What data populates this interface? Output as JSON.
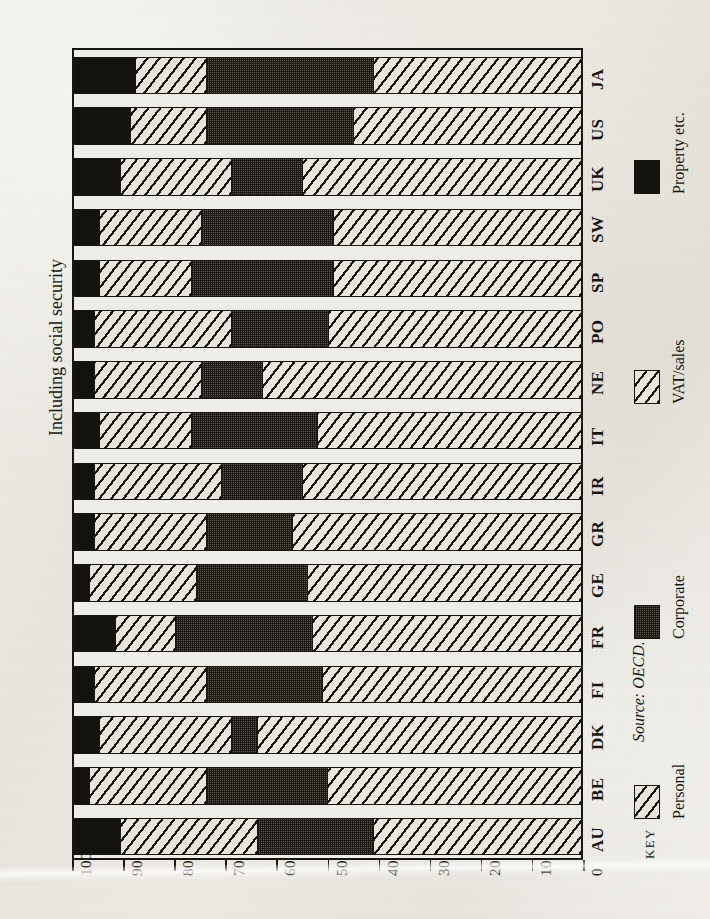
{
  "title": "Including social security",
  "source_note": "Source: OECD.",
  "key_word": "KEY",
  "axis": {
    "ticks": [
      100,
      90,
      80,
      70,
      60,
      50,
      40,
      30,
      20,
      10,
      0
    ],
    "tick_labels": [
      "100",
      "90",
      "80",
      "70",
      "60",
      "50",
      "40",
      "30",
      "20",
      "10",
      "0"
    ],
    "min": 0,
    "max": 100
  },
  "legend": [
    {
      "label": "Personal",
      "swatch": "hatch-diagonal",
      "color": "#e7e4dc"
    },
    {
      "label": "Corporate",
      "swatch": "dotted-grey",
      "color": "#5e5a52"
    },
    {
      "label": "VAT/sales",
      "swatch": "hatch-diagonal",
      "color": "#e9e6de"
    },
    {
      "label": "Property etc.",
      "swatch": "solid-black",
      "color": "#14120e"
    }
  ],
  "chart_data": {
    "type": "bar",
    "orientation": "horizontal-stacked",
    "title": "Including social security",
    "xlabel": "",
    "ylabel": "",
    "xlim": [
      0,
      100
    ],
    "axis_direction": "100 at left to 0 at right",
    "grid": false,
    "legend_position": "right",
    "categories": [
      "JA",
      "US",
      "UK",
      "SW",
      "SP",
      "PO",
      "NE",
      "IT",
      "IR",
      "GR",
      "GE",
      "FR",
      "FI",
      "DK",
      "BE",
      "AU"
    ],
    "category_order_note": "listed top to bottom as drawn on the page",
    "stack_order_from_100": [
      "Property etc.",
      "Personal",
      "Corporate",
      "VAT/sales"
    ],
    "series": [
      {
        "name": "Property etc.",
        "values": [
          12,
          11,
          9,
          5,
          5,
          4,
          4,
          5,
          4,
          4,
          3,
          8,
          4,
          5,
          3,
          9
        ]
      },
      {
        "name": "Personal",
        "values": [
          14,
          15,
          22,
          20,
          18,
          27,
          21,
          18,
          25,
          22,
          21,
          12,
          22,
          26,
          23,
          27
        ]
      },
      {
        "name": "Corporate",
        "values": [
          33,
          29,
          14,
          26,
          28,
          19,
          12,
          25,
          16,
          17,
          22,
          27,
          23,
          5,
          24,
          23
        ]
      },
      {
        "name": "VAT/sales",
        "values": [
          41,
          45,
          55,
          49,
          49,
          50,
          63,
          52,
          55,
          57,
          54,
          53,
          51,
          64,
          50,
          41
        ]
      }
    ],
    "cumulative_boundaries_note": "each bar totals 100",
    "bars": [
      {
        "category": "JA",
        "property": 12,
        "personal": 14,
        "corporate": 33,
        "vat": 41
      },
      {
        "category": "US",
        "property": 11,
        "personal": 15,
        "corporate": 29,
        "vat": 45
      },
      {
        "category": "UK",
        "property": 9,
        "personal": 22,
        "corporate": 14,
        "vat": 55
      },
      {
        "category": "SW",
        "property": 5,
        "personal": 20,
        "corporate": 26,
        "vat": 49
      },
      {
        "category": "SP",
        "property": 5,
        "personal": 18,
        "corporate": 28,
        "vat": 49
      },
      {
        "category": "PO",
        "property": 4,
        "personal": 27,
        "corporate": 19,
        "vat": 50
      },
      {
        "category": "NE",
        "property": 4,
        "personal": 21,
        "corporate": 12,
        "vat": 63
      },
      {
        "category": "IT",
        "property": 5,
        "personal": 18,
        "corporate": 25,
        "vat": 52
      },
      {
        "category": "IR",
        "property": 4,
        "personal": 25,
        "corporate": 16,
        "vat": 55
      },
      {
        "category": "GR",
        "property": 4,
        "personal": 22,
        "corporate": 17,
        "vat": 57
      },
      {
        "category": "GE",
        "property": 3,
        "personal": 21,
        "corporate": 22,
        "vat": 54
      },
      {
        "category": "FR",
        "property": 8,
        "personal": 12,
        "corporate": 27,
        "vat": 53
      },
      {
        "category": "FI",
        "property": 4,
        "personal": 22,
        "corporate": 23,
        "vat": 51
      },
      {
        "category": "DK",
        "property": 5,
        "personal": 26,
        "corporate": 5,
        "vat": 64
      },
      {
        "category": "BE",
        "property": 3,
        "personal": 23,
        "corporate": 24,
        "vat": 50
      },
      {
        "category": "AU",
        "property": 9,
        "personal": 27,
        "corporate": 23,
        "vat": 41
      }
    ]
  }
}
